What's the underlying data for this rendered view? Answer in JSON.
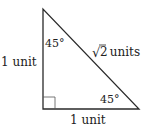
{
  "diagram": {
    "type": "right-triangle",
    "stroke_color": "#2a2a2a",
    "vertices": {
      "top": [
        43,
        9
      ],
      "right_angle": [
        43,
        109
      ],
      "bottom_right": [
        139,
        109
      ]
    },
    "labels": {
      "top_angle": "45°",
      "bottom_angle": "45°",
      "left_side": "1 unit",
      "bottom_side": "1 unit",
      "hypotenuse_radical": "√",
      "hypotenuse_number": "2",
      "hypotenuse_unit": " units"
    }
  }
}
